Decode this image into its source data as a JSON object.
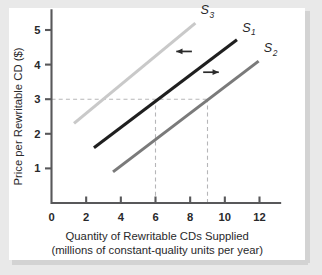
{
  "chart_data": {
    "type": "line",
    "title": "",
    "xlabel": "Quantity of Rewritable CDs Supplied",
    "xlabel_line2": "(millions of constant-quality units per year)",
    "ylabel": "Price per Rewritable CD ($)",
    "xlim": [
      0,
      13.4
    ],
    "ylim": [
      0,
      5.6
    ],
    "xticks": [
      "0",
      "2",
      "4",
      "6",
      "8",
      "10",
      "12"
    ],
    "xtick_values": [
      0,
      2,
      4,
      6,
      8,
      10,
      12
    ],
    "yticks": [
      "1",
      "2",
      "3",
      "4",
      "5"
    ],
    "ytick_values": [
      1,
      2,
      3,
      4,
      5
    ],
    "grid": false,
    "legend_position": "inline-end-labels",
    "series": [
      {
        "name": "S3",
        "label": "S",
        "sublabel": "3",
        "color": "#c9c9c9",
        "width": 3.1,
        "x": [
          1.3,
          8.3
        ],
        "y": [
          2.3,
          5.2
        ],
        "label_x": 8.6,
        "label_y": 5.45
      },
      {
        "name": "S1",
        "label": "S",
        "sublabel": "1",
        "color": "#1f1f1f",
        "width": 3.1,
        "x": [
          2.45,
          10.7
        ],
        "y": [
          1.6,
          4.72
        ],
        "label_x": 11.0,
        "label_y": 4.95
      },
      {
        "name": "S2",
        "label": "S",
        "sublabel": "2",
        "color": "#7a7a7a",
        "width": 3.1,
        "x": [
          3.55,
          11.95
        ],
        "y": [
          0.9,
          4.1
        ],
        "label_x": 12.25,
        "label_y": 4.35
      }
    ],
    "reference_lines": [
      {
        "name": "price-3-horizontal",
        "orientation": "horizontal",
        "value": 3,
        "from": 0,
        "to": 9
      },
      {
        "name": "quantity-6-vertical",
        "orientation": "vertical",
        "value": 6,
        "from": 0,
        "to": 3
      },
      {
        "name": "quantity-9-vertical",
        "orientation": "vertical",
        "value": 9,
        "from": 0,
        "to": 3
      }
    ],
    "annotations": [
      {
        "name": "leftward-shift-arrow",
        "direction": "left",
        "x_start": 8.1,
        "x_end": 7.2,
        "y": 4.38
      },
      {
        "name": "rightward-shift-arrow",
        "direction": "right",
        "x_start": 8.75,
        "x_end": 9.65,
        "y": 3.78
      }
    ],
    "equilibrium_points": [
      {
        "price": 3,
        "quantity": 6,
        "series": "S1"
      },
      {
        "price": 3,
        "quantity": 9,
        "series": "S2"
      }
    ],
    "colors": {
      "axis": "#58585a",
      "dashed": "#b6b6b8",
      "text": "#29292b",
      "arrow": "#2b2b2b",
      "frame": "#e9e9e9",
      "panel": "#ffffff"
    }
  }
}
